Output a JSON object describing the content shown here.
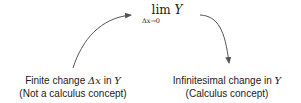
{
  "limit": {
    "operator": "lim",
    "variable": "Y",
    "subscript": "Δx→0"
  },
  "nodes": [
    {
      "id": "finite",
      "line1_prefix": "Finite change ",
      "line1_symbol": "Δx",
      "line1_mid": " in ",
      "line1_var": "Y",
      "line2": "(Not a calculus concept)"
    },
    {
      "id": "infinitesimal",
      "line1_prefix": "Infinitesimal change in ",
      "line1_var": "Y",
      "line2": "(Calculus concept)"
    }
  ],
  "arrows": [
    {
      "from": "finite",
      "to": "limit"
    },
    {
      "from": "limit",
      "to": "infinitesimal"
    }
  ],
  "colors": {
    "arrow": "#555555",
    "text": "#222222"
  }
}
